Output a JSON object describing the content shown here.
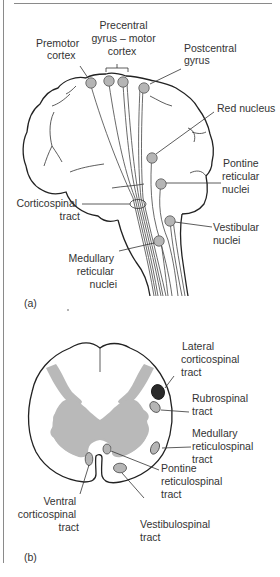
{
  "panel_a": {
    "label": "(a)",
    "labels": {
      "premotor": [
        "Premotor",
        "cortex"
      ],
      "precentral": [
        "Precentral",
        "gyrus – motor",
        "cortex"
      ],
      "postcentral": [
        "Postcentral",
        "gyrus"
      ],
      "red_nucleus": [
        "Red nucleus"
      ],
      "pontine": [
        "Pontine",
        "reticular",
        "nuclei"
      ],
      "corticospinal": [
        "Corticospinal",
        "tract"
      ],
      "vestibular": [
        "Vestibular",
        "nuclei"
      ],
      "medullary": [
        "Medullary",
        "reticular",
        "nuclei"
      ]
    }
  },
  "panel_b": {
    "label": "(b)",
    "labels": {
      "lateral_cst": [
        "Lateral",
        "corticospinal",
        "tract"
      ],
      "rubrospinal": [
        "Rubrospinal",
        "tract"
      ],
      "medullary_rst": [
        "Medullary",
        "reticulospinal",
        "tract"
      ],
      "pontine_rst": [
        "Pontine",
        "reticulospinal",
        "tract"
      ],
      "ventral_cst": [
        "Ventral",
        "corticospinal",
        "tract"
      ],
      "vestibulospinal": [
        "Vestibulospinal",
        "tract"
      ]
    }
  },
  "colors": {
    "nucleus_fill": "#b5b5b5",
    "grey_matter": "#b9b9b9",
    "lateral_cst_fill": "#2a2a2a",
    "line": "#222222"
  }
}
